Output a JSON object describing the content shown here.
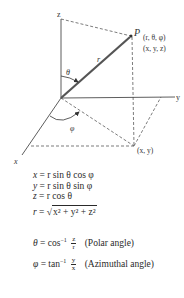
{
  "diagram": {
    "axes": {
      "x": "x",
      "y": "y",
      "z": "z"
    },
    "point": {
      "name": "P",
      "spherical": "(r, θ, φ)",
      "cartesian": "(x, y, z)"
    },
    "projection_label": "(x, y)",
    "radius_label": "r",
    "polar_angle_symbol": "θ",
    "azimuth_angle_symbol": "φ",
    "colors": {
      "radius_vector": "#555555",
      "axes": "#333333",
      "dashed": "#444444"
    }
  },
  "equations": {
    "eq1": {
      "lhs": "x",
      "rhs": "= r sin θ cos φ"
    },
    "eq2": {
      "lhs": "y",
      "rhs": "= r sin θ sin φ"
    },
    "eq3": {
      "lhs": "z",
      "rhs": "= r cos θ"
    },
    "eq4": {
      "lhs": "r",
      "eq": "=",
      "radicand": "x² + y² + z²"
    },
    "eq5": {
      "lhs": "θ",
      "eq": "= cos",
      "inv": "−1",
      "num": "z",
      "den": "r",
      "note": "(Polar angle)"
    },
    "eq6": {
      "lhs": "φ",
      "eq": "= tan",
      "inv": "−1",
      "num": "y",
      "den": "x",
      "note": "(Azimuthal angle)"
    }
  }
}
